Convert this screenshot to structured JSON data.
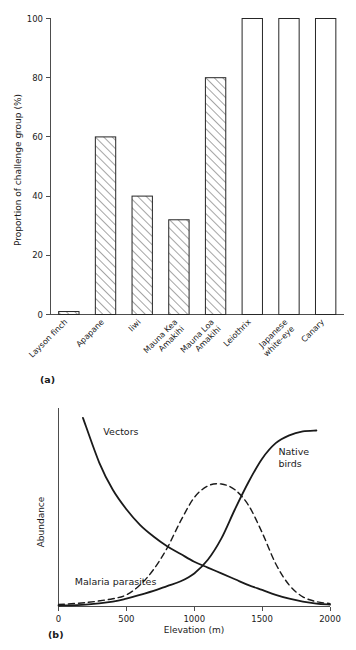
{
  "figure": {
    "panel_a_tag": "(a)",
    "panel_b_tag": "(b)"
  },
  "chart_data": [
    {
      "type": "bar",
      "panel": "(a)",
      "title": "",
      "xlabel": "",
      "ylabel": "Proportion of challenge group (%)",
      "ylim": [
        0,
        100
      ],
      "yticks": [
        0,
        20,
        40,
        60,
        80,
        100
      ],
      "ytick_labels": [
        "0",
        "20",
        "40",
        "60",
        "80",
        "100"
      ],
      "grid": false,
      "legend": "none",
      "categories": [
        "Laysan finch",
        "Apapane",
        "Iiwi",
        "Mauna Kea Amakihi",
        "Mauna Loa Amakihi",
        "Leiothrix",
        "Japanese white-eye",
        "Canary"
      ],
      "category_lines": [
        [
          "Layson finch"
        ],
        [
          "Apapane"
        ],
        [
          "Iiwi"
        ],
        [
          "Mauna Kea",
          "Amakihi"
        ],
        [
          "Mauna Loa",
          "Amakihi"
        ],
        [
          "Leiothrix"
        ],
        [
          "Japanese",
          "white-eye"
        ],
        [
          "Canary"
        ]
      ],
      "values": [
        1,
        60,
        40,
        32,
        80,
        100,
        100,
        100
      ],
      "bar_fill_styles": [
        "hatch",
        "hatch",
        "hatch",
        "hatch",
        "hatch",
        "open",
        "open",
        "open"
      ],
      "label_rotation_deg": -45
    },
    {
      "type": "line",
      "panel": "(b)",
      "title": "",
      "xlabel": "Elevation (m)",
      "ylabel": "Abundance",
      "xlim": [
        0,
        2000
      ],
      "xticks": [
        0,
        500,
        1000,
        1500,
        2000
      ],
      "xtick_labels": [
        "0",
        "500",
        "1000",
        "1500",
        "2000"
      ],
      "ylim": [
        0,
        100
      ],
      "yticks": [],
      "ytick_labels": [],
      "grid": false,
      "legend": "inline-annotations",
      "series": [
        {
          "name": "Vectors",
          "style": "solid",
          "label_x": 330,
          "label_y": 88,
          "x": [
            180,
            300,
            400,
            500,
            600,
            700,
            800,
            900,
            1000,
            1100,
            1200,
            1300,
            1400,
            1500,
            1600,
            1700,
            1800,
            1900,
            2000
          ],
          "y": [
            97,
            74,
            60,
            50,
            42,
            36,
            31,
            27,
            23,
            20,
            17,
            14,
            11,
            8.5,
            6,
            4,
            2.5,
            1.5,
            1
          ]
        },
        {
          "name": "Malaria parasites",
          "style": "dashed",
          "label_x": 120,
          "label_y": 11,
          "x": [
            0,
            200,
            400,
            500,
            600,
            700,
            800,
            900,
            1000,
            1100,
            1200,
            1300,
            1400,
            1500,
            1600,
            1700,
            1800,
            1900,
            2000
          ],
          "y": [
            1,
            2,
            4,
            6,
            11,
            19,
            30,
            44,
            56,
            62,
            63,
            60,
            52,
            38,
            22,
            11,
            5,
            2.5,
            1.5
          ]
        },
        {
          "name": "Native birds",
          "style": "solid",
          "label_lines": [
            "Native",
            "birds"
          ],
          "label_x": 1620,
          "label_y": 78,
          "x": [
            0,
            200,
            400,
            500,
            600,
            700,
            800,
            900,
            1000,
            1100,
            1200,
            1300,
            1400,
            1500,
            1600,
            1700,
            1800,
            1900
          ],
          "y": [
            0.5,
            1,
            2.5,
            4,
            6,
            8,
            10.5,
            13,
            17,
            24,
            35,
            50,
            64,
            76,
            84,
            88,
            90,
            90.5
          ]
        }
      ]
    }
  ]
}
